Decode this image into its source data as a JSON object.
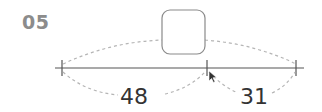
{
  "problem": {
    "number": "05",
    "answer_box": "",
    "segments": [
      {
        "label": "48"
      },
      {
        "label": "31"
      }
    ]
  },
  "colors": {
    "number": "#8c8c8c",
    "line": "#555555",
    "dashed": "#b5b5b5",
    "box_border": "#8a8a8a"
  }
}
